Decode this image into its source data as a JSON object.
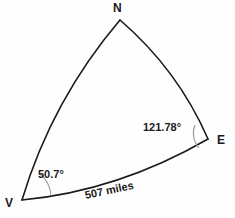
{
  "figure": {
    "type": "spherical-triangle",
    "background_color": "#fefefe",
    "line_color": "#1a1a1a",
    "arc_color": "#9a9a9a",
    "vertices": [
      {
        "id": "N",
        "label": "N",
        "x": 120,
        "y": 20
      },
      {
        "id": "E",
        "label": "E",
        "x": 208,
        "y": 139
      },
      {
        "id": "V",
        "label": "V",
        "x": 22,
        "y": 200
      }
    ],
    "angles": [
      {
        "at_vertex": "V",
        "label": "50.7°",
        "value": 50.7,
        "unit": "degrees"
      },
      {
        "at_vertex": "E",
        "label": "121.78°",
        "value": 121.78,
        "unit": "degrees"
      }
    ],
    "sides": [
      {
        "from": "V",
        "to": "E",
        "label": "507 miles",
        "value": 507,
        "unit": "miles"
      },
      {
        "from": "V",
        "to": "N",
        "label": "",
        "value": null,
        "unit": ""
      },
      {
        "from": "N",
        "to": "E",
        "label": "",
        "value": null,
        "unit": ""
      }
    ],
    "paths": {
      "edge_vn": "M 22 200 Q 52 100 120 20",
      "edge_ne": "M 120 20 Q 178 70 208 139",
      "edge_ve": "M 22 200 Q 118 191 208 139",
      "arc_v": "M 51 196 A 30 30 0 0 0 40 174",
      "arc_e": "M 195 125 A 22 22 0 0 0 199 148"
    }
  }
}
